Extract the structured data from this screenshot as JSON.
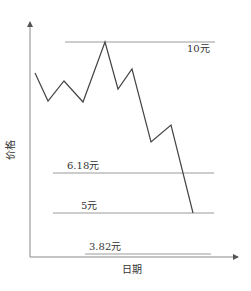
{
  "chart_data": {
    "type": "line",
    "title": "",
    "xlabel": "日期",
    "ylabel": "价格",
    "grid": false,
    "legend": null,
    "series": [
      {
        "name": "价格走势",
        "points_px": [
          [
            35,
            73
          ],
          [
            48,
            101
          ],
          [
            64,
            81
          ],
          [
            83,
            102
          ],
          [
            105,
            42
          ],
          [
            118,
            89
          ],
          [
            132,
            69
          ],
          [
            151,
            142
          ],
          [
            171,
            125
          ],
          [
            193,
            213
          ]
        ],
        "approx_values": [
          8.6,
          7.4,
          8.3,
          7.3,
          10,
          8.0,
          8.8,
          6.0,
          6.6,
          5
        ]
      }
    ],
    "reference_lines": [
      {
        "label": "10元",
        "value": 10,
        "y_px": 42,
        "x1": 65,
        "x2": 215,
        "label_x": 187,
        "label_y": 52
      },
      {
        "label": "6.18元",
        "value": 6.18,
        "y_px": 173,
        "x1": 53,
        "x2": 214,
        "label_x": 67,
        "label_y": 169
      },
      {
        "label": "5元",
        "value": 5,
        "y_px": 213,
        "x1": 53,
        "x2": 214,
        "label_x": 81,
        "label_y": 209
      },
      {
        "label": "3.82元",
        "value": 3.82,
        "y_px": 254,
        "x1": 85,
        "x2": 211,
        "label_x": 89,
        "label_y": 250
      }
    ],
    "axes": {
      "origin": [
        30,
        257
      ],
      "y_top": 22,
      "x_right": 238
    }
  },
  "labels": {
    "ylabel": "价格",
    "xlabel": "日期",
    "line_10": "10元",
    "line_618": "6.18元",
    "line_5": "5元",
    "line_382": "3.82元"
  },
  "colors": {
    "axis": "#8a8a8a",
    "price_line": "#444444",
    "ref_line": "#9a9a9a",
    "text": "#333333"
  }
}
